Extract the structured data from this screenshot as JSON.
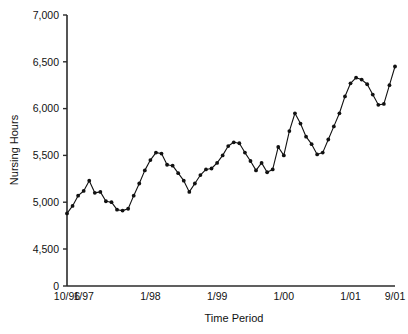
{
  "chart_data": {
    "type": "line",
    "title": "",
    "xlabel": "Time Period",
    "ylabel": "Nursing Hours",
    "grid": false,
    "legend": null,
    "markers": "filled-circle",
    "axis_break": true,
    "ylim": [
      4500,
      7000
    ],
    "ytick_labels": [
      "7,000",
      "6,500",
      "6,000",
      "5,500",
      "5,000",
      "4,500",
      "0"
    ],
    "ytick_values": [
      7000,
      6500,
      6000,
      5500,
      5000,
      4500,
      0
    ],
    "xtick_labels": [
      "10/96",
      "1/97",
      "1/98",
      "1/99",
      "1/00",
      "1/01",
      "9/01"
    ],
    "xtick_indices": [
      0,
      3,
      15,
      27,
      39,
      51,
      59
    ],
    "x": [
      "10/96",
      "11/96",
      "12/96",
      "1/97",
      "2/97",
      "3/97",
      "4/97",
      "5/97",
      "6/97",
      "7/97",
      "8/97",
      "9/97",
      "10/97",
      "11/97",
      "12/97",
      "1/98",
      "2/98",
      "3/98",
      "4/98",
      "5/98",
      "6/98",
      "7/98",
      "8/98",
      "9/98",
      "10/98",
      "11/98",
      "12/98",
      "1/99",
      "2/99",
      "3/99",
      "4/99",
      "5/99",
      "6/99",
      "7/99",
      "8/99",
      "9/99",
      "10/99",
      "11/99",
      "12/99",
      "1/00",
      "2/00",
      "3/00",
      "4/00",
      "5/00",
      "6/00",
      "7/00",
      "8/00",
      "9/00",
      "10/00",
      "11/00",
      "12/00",
      "1/01",
      "2/01",
      "3/01",
      "4/01",
      "5/01",
      "6/01",
      "7/01",
      "8/01",
      "9/01"
    ],
    "values": [
      4880,
      4960,
      5070,
      5120,
      5230,
      5100,
      5110,
      5010,
      5000,
      4920,
      4910,
      4930,
      5070,
      5200,
      5340,
      5450,
      5530,
      5520,
      5400,
      5390,
      5310,
      5230,
      5110,
      5200,
      5290,
      5350,
      5360,
      5420,
      5500,
      5600,
      5640,
      5630,
      5530,
      5440,
      5340,
      5420,
      5320,
      5350,
      5590,
      5500,
      5760,
      5950,
      5840,
      5700,
      5620,
      5510,
      5530,
      5670,
      5810,
      5950,
      6130,
      6270,
      6330,
      6310,
      6260,
      6150,
      6040,
      6050,
      6250,
      6450
    ]
  },
  "axes": {
    "y_axis_label": "Nursing Hours",
    "x_axis_label": "Time Period"
  }
}
